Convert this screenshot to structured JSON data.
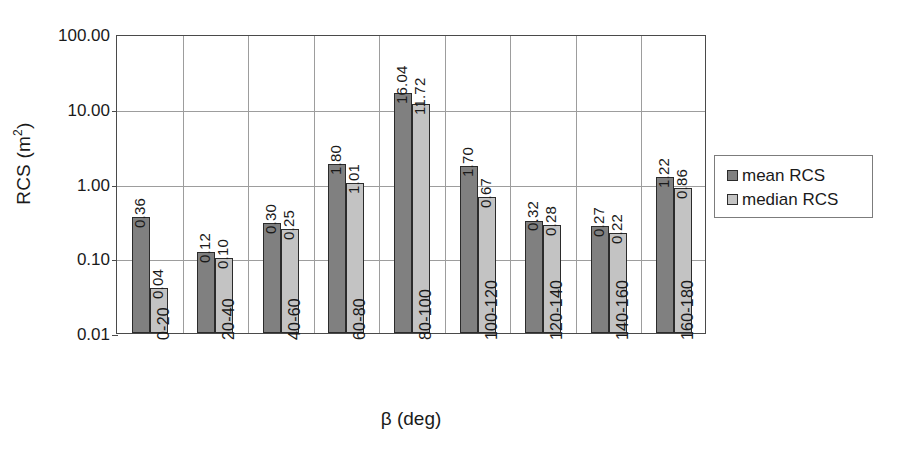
{
  "chart_data": {
    "type": "bar",
    "title": "",
    "subtitle": "",
    "xlabel": "β (deg)",
    "ylabel": "RCS (m²)",
    "ylabel_base": "RCS (m",
    "ylabel_exponent": "2",
    "ylabel_tail": ")",
    "yscale": "log",
    "ylim": [
      0.01,
      100.0
    ],
    "grid": true,
    "legend_position": "right",
    "categories": [
      "0-20",
      "20-40",
      "40-60",
      "60-80",
      "80-100",
      "100-120",
      "120-140",
      "140-160",
      "160-180"
    ],
    "y_ticks": [
      {
        "value": 100.0,
        "label": "100.00"
      },
      {
        "value": 10.0,
        "label": "10.00"
      },
      {
        "value": 1.0,
        "label": "1.00"
      },
      {
        "value": 0.1,
        "label": "0.10"
      },
      {
        "value": 0.01,
        "label": "0.01"
      }
    ],
    "series": [
      {
        "name": "mean RCS",
        "color": "#808080",
        "values": [
          0.36,
          0.12,
          0.3,
          1.8,
          16.04,
          1.7,
          0.32,
          0.27,
          1.22
        ],
        "labels": [
          "0.36",
          "0.12",
          "0.30",
          "1.80",
          "16.04",
          "1.70",
          "0.32",
          "0.27",
          "1.22"
        ]
      },
      {
        "name": "median RCS",
        "color": "#c3c3c3",
        "values": [
          0.04,
          0.1,
          0.25,
          1.01,
          11.72,
          0.67,
          0.28,
          0.22,
          0.86
        ],
        "labels": [
          "0.04",
          "0.10",
          "0.25",
          "1.01",
          "11.72",
          "0.67",
          "0.28",
          "0.22",
          "0.86"
        ]
      }
    ]
  },
  "legend": {
    "items": [
      {
        "label": "mean RCS",
        "swatch": "mean"
      },
      {
        "label": "median RCS",
        "swatch": "median"
      }
    ]
  }
}
